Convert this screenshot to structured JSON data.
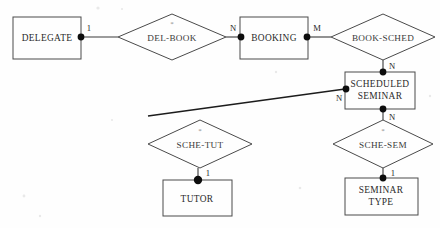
{
  "diagram": {
    "type": "entity-relationship-diagram",
    "notation": "chen",
    "background_color": "#fefefe",
    "line_color": "#3a3a3a",
    "entities": [
      {
        "id": "delegate",
        "label": "DELEGATE",
        "label_line1": "DELEGATE",
        "label_line2": "",
        "x": 13,
        "y": 17,
        "w": 68,
        "h": 42
      },
      {
        "id": "booking",
        "label": "BOOKING",
        "label_line1": "BOOKING",
        "label_line2": "",
        "x": 240,
        "y": 17,
        "w": 68,
        "h": 42
      },
      {
        "id": "scheduled_seminar",
        "label": "SCHEDULED SEMINAR",
        "label_line1": "SCHEDULED",
        "label_line2": "SEMINAR",
        "x": 345,
        "y": 72,
        "w": 70,
        "h": 37
      },
      {
        "id": "tutor",
        "label": "TUTOR",
        "label_line1": "TUTOR",
        "label_line2": "",
        "x": 163,
        "y": 180,
        "w": 69,
        "h": 36
      },
      {
        "id": "seminar_type",
        "label": "SEMINAR TYPE",
        "label_line1": "SEMINAR",
        "label_line2": "TYPE",
        "x": 345,
        "y": 178,
        "w": 73,
        "h": 37
      }
    ],
    "relationships": [
      {
        "id": "del_book",
        "label": "DEL-BOOK",
        "asterisk": "*",
        "has_asterisk": true,
        "cx": 172,
        "cy": 37,
        "rx": 54,
        "ry": 23
      },
      {
        "id": "book_sched",
        "label": "BOOK-SCHED",
        "asterisk": "",
        "has_asterisk": false,
        "cx": 383,
        "cy": 37,
        "rx": 52,
        "ry": 23
      },
      {
        "id": "sche_tut",
        "label": "SCHE-TUT",
        "asterisk": "*",
        "has_asterisk": true,
        "cx": 200,
        "cy": 144,
        "rx": 52,
        "ry": 24
      },
      {
        "id": "sche_sem",
        "label": "SCHE-SEM",
        "asterisk": "*",
        "has_asterisk": true,
        "cx": 383,
        "cy": 144,
        "rx": 50,
        "ry": 24
      }
    ],
    "connections": [
      {
        "id": "delegate-del_book",
        "from": "delegate",
        "to": "del_book",
        "cardinality": "1",
        "label_x": 89,
        "label_y": 30
      },
      {
        "id": "del_book-booking",
        "from": "del_book",
        "to": "booking",
        "cardinality": "N",
        "label_x": 233,
        "label_y": 30
      },
      {
        "id": "booking-book_sched",
        "from": "booking",
        "to": "book_sched",
        "cardinality": "M",
        "label_x": 317,
        "label_y": 30
      },
      {
        "id": "book_sched-scheduled_seminar",
        "from": "book_sched",
        "to": "scheduled_seminar",
        "cardinality": "N",
        "label_x": 392,
        "label_y": 66
      },
      {
        "id": "scheduled_seminar-sche_tut",
        "from": "scheduled_seminar",
        "to": "sche_tut",
        "cardinality": "N",
        "label_x": 338,
        "label_y": 102
      },
      {
        "id": "sche_tut-tutor",
        "from": "sche_tut",
        "to": "tutor",
        "cardinality": "1",
        "label_x": 207,
        "label_y": 176
      },
      {
        "id": "scheduled_seminar-sche_sem",
        "from": "scheduled_seminar",
        "to": "sche_sem",
        "cardinality": "N",
        "label_x": 392,
        "label_y": 120
      },
      {
        "id": "sche_sem-seminar_type",
        "from": "sche_sem",
        "to": "seminar_type",
        "cardinality": "1",
        "label_x": 392,
        "label_y": 174
      }
    ]
  }
}
